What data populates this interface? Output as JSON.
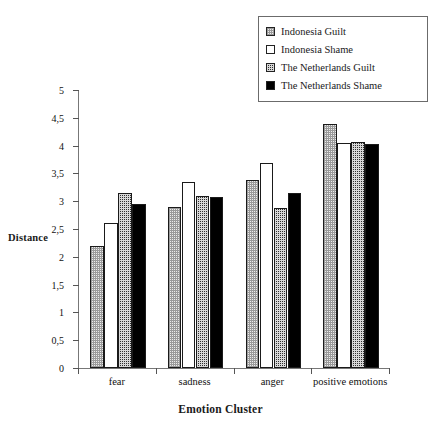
{
  "chart_data": {
    "type": "bar",
    "title": "",
    "xlabel": "Emotion Cluster",
    "ylabel": "Distance",
    "categories": [
      "fear",
      "sadness",
      "anger",
      "positive emotions"
    ],
    "series": [
      {
        "name": "Indonesia Guilt",
        "values": [
          2.2,
          2.9,
          3.38,
          4.38
        ]
      },
      {
        "name": "Indonesia Shame",
        "values": [
          2.6,
          3.35,
          3.68,
          4.05
        ]
      },
      {
        "name": "The Netherlands Guilt",
        "values": [
          3.15,
          3.1,
          2.87,
          4.07
        ]
      },
      {
        "name": "The Netherlands Shame",
        "values": [
          2.95,
          3.08,
          3.15,
          4.03
        ]
      }
    ],
    "ylim": [
      0,
      5
    ],
    "ytick_labels": [
      "0",
      "0,5",
      "1",
      "1,5",
      "2",
      "2,5",
      "3",
      "3,5",
      "4",
      "4,5",
      "5"
    ],
    "ytick_values": [
      0,
      0.5,
      1,
      1.5,
      2,
      2.5,
      3,
      3.5,
      4,
      4.5,
      5
    ],
    "grid": false,
    "legend_position": "top-right"
  },
  "legend": {
    "items": [
      {
        "label": "Indonesia Guilt",
        "swatch": "light-dotted-swatch"
      },
      {
        "label": "Indonesia Shame",
        "swatch": "white-swatch"
      },
      {
        "label": "The Netherlands Guilt",
        "swatch": "dark-dotted-swatch"
      },
      {
        "label": "The Netherlands Shame",
        "swatch": "black-swatch"
      }
    ]
  }
}
